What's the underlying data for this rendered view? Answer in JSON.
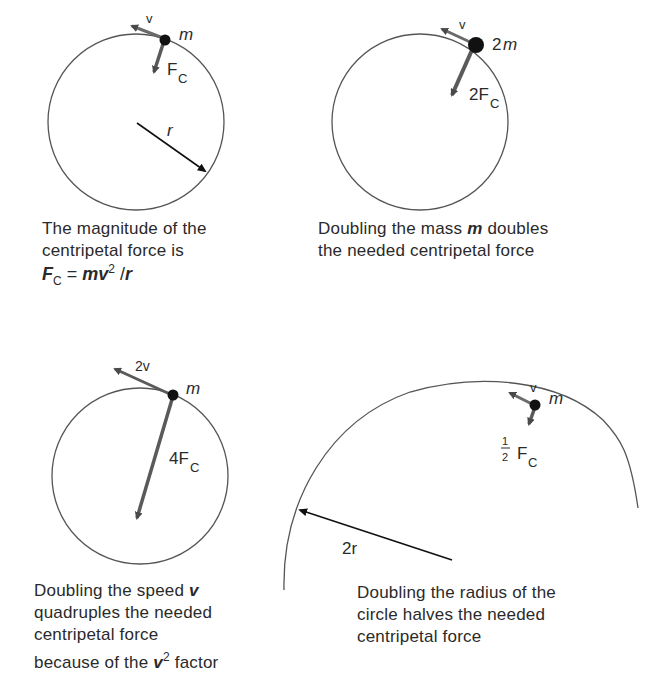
{
  "panels": [
    {
      "id": "baseline",
      "labels": {
        "velocity": "v",
        "mass": "m",
        "force": "F",
        "force_sub": "C",
        "radius": "r"
      },
      "caption": [
        "The magnitude of the",
        "centripetal force is"
      ],
      "formula": {
        "lhs": "F",
        "lhs_sub": "C",
        "eq": " = ",
        "mv": "mv",
        "exp": "2",
        "rest": " /",
        "r": "r"
      }
    },
    {
      "id": "double-mass",
      "labels": {
        "velocity": "v",
        "mass_coef": "2",
        "mass": "m",
        "force": "2F",
        "force_sub": "C"
      },
      "caption": {
        "line1_pre": "Doubling the mass ",
        "line1_var": "m",
        "line1_post": " doubles",
        "line2": "the  needed centripetal force"
      }
    },
    {
      "id": "double-speed",
      "labels": {
        "velocity": "2v",
        "mass": "m",
        "force": "4F",
        "force_sub": "C"
      },
      "caption": {
        "line1_pre": "Doubling the speed ",
        "line1_var": "v",
        "line2": "quadruples the needed",
        "line3": "centripetal force",
        "line4_pre": "because of the ",
        "line4_var": "v",
        "line4_exp": "2",
        "line4_post": " factor"
      }
    },
    {
      "id": "double-radius",
      "labels": {
        "velocity": "v",
        "mass": "m",
        "frac_num": "1",
        "frac_den": "2",
        "force": "F",
        "force_sub": "C",
        "radius": "2r"
      },
      "caption": [
        "Doubling the radius of the",
        "circle halves the needed",
        "centripetal force"
      ]
    }
  ],
  "colors": {
    "line": "#555555",
    "arrow": "#5a5a5a",
    "mass": "#111111",
    "text": "#2a2a2a"
  }
}
